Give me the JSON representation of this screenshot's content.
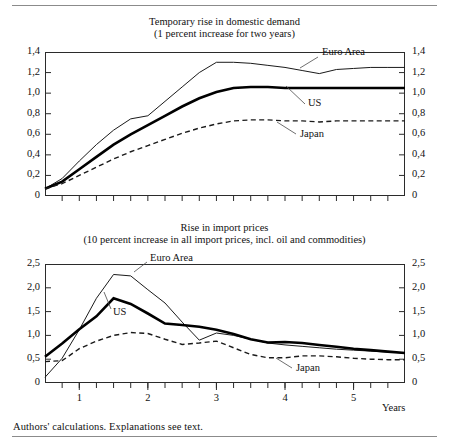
{
  "footnote": "Authors' calculations. Explanations see text.",
  "years_axis_label": "Years",
  "panels": [
    {
      "title_line1": "Temporary rise in domestic demand",
      "title_line2": "(1 percent increase for two years)",
      "y_ticks": [
        "1,4",
        "1,2",
        "1,0",
        "0,8",
        "0,6",
        "0,4",
        "0,2",
        "0"
      ],
      "series_labels": {
        "euro": "Euro Area",
        "us": "US",
        "japan": "Japan"
      }
    },
    {
      "title_line1": "Rise in import prices",
      "title_line2": "(10 percent increase in all import prices, incl. oil and commodities)",
      "y_ticks": [
        "2,5",
        "2,0",
        "1,5",
        "1,0",
        "0,5",
        "0"
      ],
      "x_ticks": [
        "1",
        "2",
        "3",
        "4",
        "5"
      ],
      "series_labels": {
        "euro": "Euro Area",
        "us": "US",
        "japan": "Japan"
      }
    }
  ],
  "chart_data": [
    {
      "type": "line",
      "title": "Temporary rise in domestic demand (1 percent increase for two years)",
      "xlabel": "Years",
      "ylabel": "",
      "xlim": [
        0.5,
        5.75
      ],
      "ylim": [
        0,
        1.4
      ],
      "yticks": [
        0,
        0.2,
        0.4,
        0.6,
        0.8,
        1.0,
        1.2,
        1.4
      ],
      "xticks": [
        1,
        2,
        3,
        4,
        5
      ],
      "grid": false,
      "legend": "inline-annotations",
      "x": [
        0.5,
        0.75,
        1.0,
        1.25,
        1.5,
        1.75,
        2.0,
        2.25,
        2.5,
        2.75,
        3.0,
        3.25,
        3.5,
        3.75,
        4.0,
        4.25,
        4.5,
        4.75,
        5.0,
        5.25,
        5.5,
        5.75
      ],
      "series": [
        {
          "name": "Euro Area",
          "style": "thin-solid",
          "values": [
            0.07,
            0.17,
            0.34,
            0.5,
            0.64,
            0.75,
            0.78,
            0.92,
            1.06,
            1.2,
            1.3,
            1.3,
            1.29,
            1.27,
            1.25,
            1.22,
            1.19,
            1.23,
            1.24,
            1.25,
            1.25,
            1.25
          ]
        },
        {
          "name": "US",
          "style": "thick-solid",
          "values": [
            0.07,
            0.14,
            0.26,
            0.38,
            0.5,
            0.6,
            0.69,
            0.78,
            0.87,
            0.95,
            1.01,
            1.05,
            1.06,
            1.06,
            1.05,
            1.05,
            1.05,
            1.05,
            1.05,
            1.05,
            1.05,
            1.05
          ]
        },
        {
          "name": "Japan",
          "style": "dashed",
          "values": [
            0.07,
            0.12,
            0.2,
            0.28,
            0.36,
            0.43,
            0.49,
            0.55,
            0.61,
            0.66,
            0.7,
            0.73,
            0.74,
            0.74,
            0.73,
            0.73,
            0.72,
            0.73,
            0.73,
            0.73,
            0.73,
            0.73
          ]
        }
      ]
    },
    {
      "type": "line",
      "title": "Rise in import prices (10 percent increase in all import prices, incl. oil and commodities)",
      "xlabel": "Years",
      "ylabel": "",
      "xlim": [
        0.5,
        5.75
      ],
      "ylim": [
        0,
        2.5
      ],
      "yticks": [
        0,
        0.5,
        1.0,
        1.5,
        2.0,
        2.5
      ],
      "xticks": [
        1,
        2,
        3,
        4,
        5
      ],
      "grid": false,
      "legend": "inline-annotations",
      "x": [
        0.5,
        0.75,
        1.0,
        1.25,
        1.5,
        1.75,
        2.0,
        2.25,
        2.5,
        2.75,
        3.0,
        3.25,
        3.5,
        3.75,
        4.0,
        4.25,
        4.5,
        4.75,
        5.0,
        5.25,
        5.5,
        5.75
      ],
      "series": [
        {
          "name": "Euro Area",
          "style": "thin-solid",
          "values": [
            0.12,
            0.52,
            1.12,
            1.78,
            2.28,
            2.25,
            1.96,
            1.68,
            1.28,
            0.9,
            1.05,
            1.0,
            0.92,
            0.84,
            0.8,
            0.77,
            0.74,
            0.71,
            0.69,
            0.67,
            0.65,
            0.63
          ]
        },
        {
          "name": "US",
          "style": "thick-solid",
          "values": [
            0.55,
            0.83,
            1.13,
            1.4,
            1.78,
            1.66,
            1.46,
            1.25,
            1.22,
            1.18,
            1.12,
            1.03,
            0.92,
            0.85,
            0.86,
            0.84,
            0.8,
            0.76,
            0.72,
            0.69,
            0.66,
            0.63
          ]
        },
        {
          "name": "Japan",
          "style": "dashed",
          "values": [
            0.45,
            0.47,
            0.72,
            0.88,
            1.0,
            1.06,
            1.04,
            0.92,
            0.81,
            0.84,
            0.88,
            0.74,
            0.6,
            0.53,
            0.53,
            0.57,
            0.57,
            0.55,
            0.52,
            0.5,
            0.49,
            0.49
          ]
        }
      ]
    }
  ]
}
